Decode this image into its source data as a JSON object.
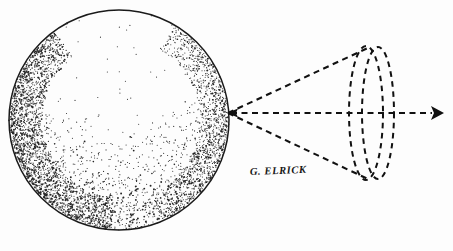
{
  "figure": {
    "background_color": "#fdfdfd",
    "ink_color": "#1a1a1a",
    "width": 453,
    "height": 251,
    "signature": "G. ELRICK"
  },
  "chart_data": {
    "type": "diagram",
    "xlabel": "",
    "ylabel": "",
    "elements": [
      {
        "name": "sphere",
        "shape": "circle",
        "center_x": 119,
        "center_y": 120,
        "radius": 110,
        "stroke": "#1a1a1a",
        "fill": "none",
        "shading": "stipple"
      },
      {
        "name": "stipple-shading",
        "shape": "point-cloud",
        "description": "dense stippling along lower-left limb fading toward upper-right interior",
        "dot_count": 4200,
        "dot_color": "#262626"
      },
      {
        "name": "cone-apex",
        "shape": "point",
        "x": 228,
        "y": 113
      },
      {
        "name": "cone-upper-edge",
        "shape": "line",
        "x1": 228,
        "y1": 113,
        "x2": 370,
        "y2": 47,
        "style": "dashed"
      },
      {
        "name": "cone-lower-edge",
        "shape": "line",
        "x1": 228,
        "y1": 113,
        "x2": 370,
        "y2": 180,
        "style": "dashed"
      },
      {
        "name": "cone-base-ellipse-front",
        "shape": "ellipse",
        "center_x": 366,
        "center_y": 113,
        "rx": 17,
        "ry": 67,
        "style": "dashed"
      },
      {
        "name": "cone-base-ellipse-back",
        "shape": "ellipse",
        "center_x": 378,
        "center_y": 113,
        "rx": 16,
        "ry": 66,
        "style": "dashed"
      },
      {
        "name": "axis-line",
        "shape": "line",
        "x1": 228,
        "y1": 113,
        "x2": 440,
        "y2": 113,
        "style": "dashed",
        "arrow_left": true,
        "arrow_right": true
      },
      {
        "name": "axis-arrowhead-right",
        "shape": "arrowhead",
        "x": 441,
        "y": 113,
        "direction": "right"
      },
      {
        "name": "axis-arrowhead-left",
        "shape": "arrowhead",
        "x": 228,
        "y": 113,
        "direction": "left"
      }
    ],
    "annotations": [
      {
        "text": "G. ELRICK",
        "x": 250,
        "y": 176,
        "role": "artist-signature"
      }
    ]
  }
}
